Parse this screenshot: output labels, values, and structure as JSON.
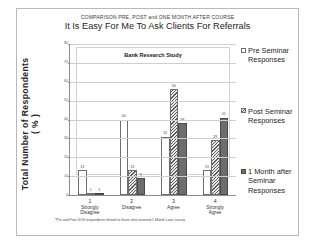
{
  "supertitle": "COMPARISON PRE,  POST and ONE MONTH AFTER COURSE",
  "title": "It Is Easy For Me To Ask Clients For Referrals",
  "inner_box_label": "Bank Research Study",
  "y_axis_title": "Total Number of Respondents\n( % )",
  "footnote": "*Pre and Post SOS respondents limited to those who returned 1 Month Later survey",
  "legend": {
    "items": [
      {
        "label": "Pre Seminar Responses",
        "swatch": "pre",
        "color": "#ffffff"
      },
      {
        "label": "Post Seminar Responses",
        "swatch": "post",
        "color": "#5c5c5c"
      },
      {
        "label": "1 Month after Seminar Responses",
        "swatch": "month",
        "color": "#6d6d6d"
      }
    ]
  },
  "chart_data": {
    "type": "bar",
    "title": "It Is Easy For Me To Ask Clients For Referrals",
    "subtitle": "COMPARISON PRE,  POST and ONE MONTH AFTER COURSE",
    "xlabel": "",
    "ylabel": "Total Number of Respondents ( % )",
    "ylim": [
      0,
      80
    ],
    "yticks": [
      0,
      10,
      20,
      30,
      40,
      50,
      60,
      70,
      80
    ],
    "grid": true,
    "legend_position": "right",
    "categories": [
      "1 Strongly Disagree",
      "2 Disagree",
      "3 Agree",
      "4 Strongly Agree"
    ],
    "category_numbers": [
      "1",
      "2",
      "3",
      "4"
    ],
    "category_labels": [
      "Strongly Disagree",
      "Disagree",
      "Agree",
      "Strongly Agree"
    ],
    "series": [
      {
        "name": "Pre Seminar Responses",
        "values": [
          13,
          40,
          31,
          13
        ]
      },
      {
        "name": "Post Seminar Responses",
        "values": [
          1,
          13,
          56,
          29
        ]
      },
      {
        "name": "1 Month after Seminar Responses",
        "values": [
          1,
          9,
          38,
          41
        ]
      }
    ]
  }
}
